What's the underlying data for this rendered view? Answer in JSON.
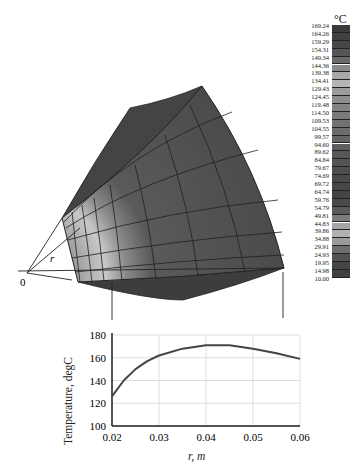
{
  "figure": {
    "point_label": "r",
    "origin_label": "0"
  },
  "colorbar": {
    "unit": "°C",
    "levels": [
      "169.24",
      "164.26",
      "159.29",
      "154.31",
      "149.34",
      "144.36",
      "139.38",
      "134.41",
      "129.43",
      "124.45",
      "119.48",
      "114.50",
      "109.53",
      "104.55",
      "99.57",
      "94.60",
      "89.62",
      "84.84",
      "79.67",
      "74.69",
      "69.72",
      "64.74",
      "59.76",
      "54.79",
      "49.81",
      "44.83",
      "39.86",
      "34.88",
      "29.91",
      "24.93",
      "19.95",
      "14.98",
      "10.00"
    ],
    "colors": [
      "#3a3a3a",
      "#404040",
      "#474747",
      "#555555",
      "#6a6a6a",
      "#8a8a8a",
      "#a8a8a8",
      "#b5b5b5",
      "#9c9c9c",
      "#8e8e8e",
      "#838383",
      "#7a7a7a",
      "#727272",
      "#6c6c6c",
      "#656565",
      "#5e5e5e",
      "#585858",
      "#535353",
      "#4e4e4e",
      "#4a4a4a",
      "#474747",
      "#454545",
      "#4a4a4a",
      "#5a5a5a",
      "#7c7c7c",
      "#a4a4a4",
      "#b0b0b0",
      "#9a9a9a",
      "#6e6e6e",
      "#525252",
      "#454545",
      "#404040"
    ]
  },
  "chart_data": {
    "type": "line",
    "title": "",
    "xlabel": "r, m",
    "ylabel": "Temperature, degC",
    "xlim": [
      0.02,
      0.06
    ],
    "ylim": [
      100,
      180
    ],
    "xticks": [
      "0.02",
      "0.03",
      "0.04",
      "0.05",
      "0.06"
    ],
    "yticks": [
      "100",
      "120",
      "140",
      "160",
      "180"
    ],
    "grid": true,
    "series": [
      {
        "name": "Temperature",
        "x": [
          0.02,
          0.0225,
          0.025,
          0.0275,
          0.03,
          0.035,
          0.04,
          0.045,
          0.05,
          0.055,
          0.06
        ],
        "values": [
          126,
          140,
          150,
          157,
          162,
          168,
          171,
          171,
          168,
          164,
          159
        ]
      }
    ]
  }
}
